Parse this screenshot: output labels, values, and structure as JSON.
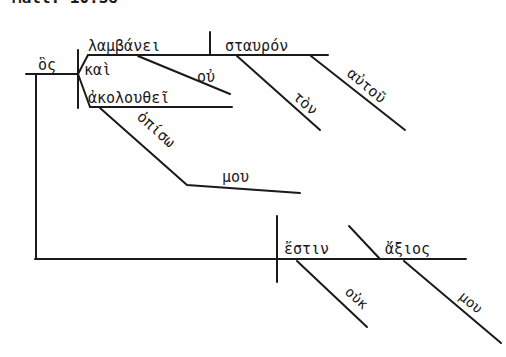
{
  "header": {
    "reference": "Matt. 10:38"
  },
  "diagram": {
    "type": "sentence-diagram",
    "language": "Greek",
    "words": {
      "conjunction_main": "ὃς",
      "verb_1": "λαμβάνει",
      "direct_object": "σταυρόν",
      "article": "τὸν",
      "possessive": "αὐτοῦ",
      "negation_1": "οὐ",
      "coordinating_conj": "καὶ",
      "verb_2": "ἀκολουθεῖ",
      "adverb": "ὀπίσω",
      "genitive_1": "μου",
      "main_verb": "ἔστιν",
      "predicate": "ἄξιος",
      "negation_2": "οὐκ",
      "genitive_2": "μου"
    },
    "colors": {
      "ink": "#1a1a1a",
      "paper": "#ffffff"
    }
  }
}
